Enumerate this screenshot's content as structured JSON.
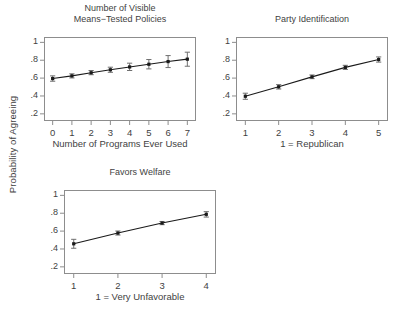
{
  "figure": {
    "shared_ylabel": "Probability of Agreeing",
    "marker_color": "#1a1a1a",
    "line_color": "#1a1a1a",
    "error_color": "#6f6f6f",
    "frame_color": "#8d8d8d",
    "background": "#ffffff"
  },
  "chart_data": [
    {
      "type": "line",
      "title": "Number of Visible\nMeans−Tested Policies",
      "xlabel": "Number of Programs Ever Used",
      "ylabel": "Probability of Agreeing",
      "xlim": [
        -0.45,
        7.45
      ],
      "ylim": [
        0.12,
        1.06
      ],
      "xticks": [
        0,
        1,
        2,
        3,
        4,
        5,
        6,
        7
      ],
      "xticklabels": [
        "0",
        "1",
        "2",
        "3",
        "4",
        "5",
        "6",
        "7"
      ],
      "yticks": [
        0.2,
        0.4,
        0.6,
        0.8,
        1.0
      ],
      "yticklabels": [
        ".2",
        ".4",
        ".6",
        ".8",
        "1"
      ],
      "grid": false,
      "legend": "none",
      "x": [
        0,
        1,
        2,
        3,
        4,
        5,
        6,
        7
      ],
      "values": [
        0.595,
        0.625,
        0.66,
        0.693,
        0.725,
        0.755,
        0.785,
        0.812
      ],
      "err_low": [
        0.565,
        0.602,
        0.638,
        0.665,
        0.685,
        0.703,
        0.718,
        0.733
      ],
      "err_high": [
        0.625,
        0.648,
        0.685,
        0.722,
        0.767,
        0.808,
        0.852,
        0.89
      ]
    },
    {
      "type": "line",
      "title": "Party Identification",
      "xlabel": "1 = Republican",
      "ylabel": "Probability of Agreeing",
      "xlim": [
        0.72,
        5.28
      ],
      "ylim": [
        0.12,
        1.06
      ],
      "xticks": [
        1,
        2,
        3,
        4,
        5
      ],
      "xticklabels": [
        "1",
        "2",
        "3",
        "4",
        "5"
      ],
      "yticks": [
        0.2,
        0.4,
        0.6,
        0.8,
        1.0
      ],
      "yticklabels": [
        ".2",
        ".4",
        ".6",
        ".8",
        "1"
      ],
      "grid": false,
      "legend": "none",
      "x": [
        1,
        2,
        3,
        4,
        5
      ],
      "values": [
        0.397,
        0.503,
        0.614,
        0.72,
        0.808
      ],
      "err_low": [
        0.363,
        0.478,
        0.594,
        0.697,
        0.779
      ],
      "err_high": [
        0.431,
        0.527,
        0.635,
        0.743,
        0.837
      ]
    },
    {
      "type": "line",
      "title": "Favors Welfare",
      "xlabel": "1 = Very Unfavorable",
      "ylabel": "Probability of Agreeing",
      "xlim": [
        0.78,
        4.22
      ],
      "ylim": [
        0.12,
        1.06
      ],
      "xticks": [
        1,
        2,
        3,
        4
      ],
      "xticklabels": [
        "1",
        "2",
        "3",
        "4"
      ],
      "yticks": [
        0.2,
        0.4,
        0.6,
        0.8,
        1.0
      ],
      "yticklabels": [
        ".2",
        ".4",
        ".6",
        ".8",
        "1"
      ],
      "grid": false,
      "legend": "none",
      "x": [
        1,
        2,
        3,
        4
      ],
      "values": [
        0.458,
        0.578,
        0.69,
        0.788
      ],
      "err_low": [
        0.408,
        0.556,
        0.672,
        0.757
      ],
      "err_high": [
        0.508,
        0.601,
        0.708,
        0.818
      ]
    }
  ]
}
